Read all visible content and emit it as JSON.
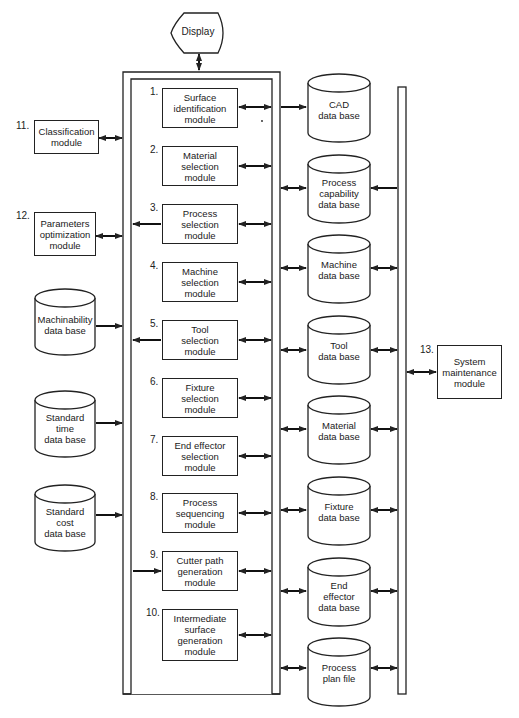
{
  "display": {
    "label": "Display"
  },
  "modules": [
    {
      "num": "1.",
      "label": "Surface\nidentification\nmodule"
    },
    {
      "num": "2.",
      "label": "Material\nselection\nmodule"
    },
    {
      "num": "3.",
      "label": "Process\nselection\nmodule"
    },
    {
      "num": "4.",
      "label": "Machine\nselection\nmodule"
    },
    {
      "num": "5.",
      "label": "Tool\nselection\nmodule"
    },
    {
      "num": "6.",
      "label": "Fixture\nselection\nmodule"
    },
    {
      "num": "7.",
      "label": "End effector\nselection\nmodule"
    },
    {
      "num": "8.",
      "label": "Process\nsequencing\nmodule"
    },
    {
      "num": "9.",
      "label": "Cutter path\ngeneration\nmodule"
    },
    {
      "num": "10.",
      "label": "Intermediate\nsurface\ngeneration\nmodule"
    }
  ],
  "left_modules": [
    {
      "num": "11.",
      "label": "Classification\nmodule"
    },
    {
      "num": "12.",
      "label": "Parameters\noptimization\nmodule"
    }
  ],
  "left_databases": [
    {
      "label": "Machinability\ndata base"
    },
    {
      "label": "Standard\ntime\ndata base"
    },
    {
      "label": "Standard\ncost\ndata base"
    }
  ],
  "right_databases": [
    {
      "label": "CAD\ndata base"
    },
    {
      "label": "Process\ncapability\ndata base"
    },
    {
      "label": "Machine\ndata base"
    },
    {
      "label": "Tool\ndata base"
    },
    {
      "label": "Material\ndata base"
    },
    {
      "label": "Fixture\ndata base"
    },
    {
      "label": "End\neffector\ndata base"
    },
    {
      "label": "Process\nplan file"
    }
  ],
  "system_module": {
    "num": "13.",
    "label": "System\nmaintenance\nmodule"
  }
}
